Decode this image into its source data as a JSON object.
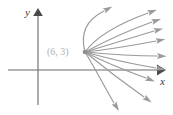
{
  "figure": {
    "type": "vector-field-diagram",
    "background_color": "#ffffff",
    "width": 173,
    "height": 115
  },
  "axes": {
    "x_label": "x",
    "y_label": "y",
    "axis_color": "#6b6b6b",
    "origin_px": [
      38,
      70
    ],
    "x_axis_px": [
      8,
      70,
      160,
      70
    ],
    "y_axis_px": [
      38,
      105,
      38,
      12
    ],
    "ticks": [],
    "grid": false
  },
  "annotations": {
    "point_label": "(6, 3)",
    "point_label_color": "#b2b2b2",
    "point_px": [
      85,
      52
    ]
  },
  "chart_data": {
    "type": "scatter",
    "title": "",
    "xlabel": "x",
    "ylabel": "y",
    "grid": false,
    "legend": "none",
    "curve_color": "#9a9a9a",
    "source_point": {
      "label": "(6, 3)",
      "x": 6,
      "y": 3
    },
    "curves": [
      {
        "id": "curve-1",
        "path": "M 85 52 C 80 34 86 20 104 11",
        "tip": [
          104,
          11
        ],
        "angle_deg": -28
      },
      {
        "id": "curve-2",
        "path": "M 85 52 C 95 38 118 24 148 13",
        "tip": [
          148,
          13
        ],
        "angle_deg": -20
      },
      {
        "id": "curve-3",
        "path": "M 85 52 C 100 44 124 32 152 22",
        "tip": [
          152,
          22
        ],
        "angle_deg": -18
      },
      {
        "id": "curve-4",
        "path": "M 85 52 C 102 47 128 39 154 31",
        "tip": [
          154,
          31
        ],
        "angle_deg": -15
      },
      {
        "id": "curve-5",
        "path": "M 85 52 C 104 50 130 46 156 41",
        "tip": [
          156,
          41
        ],
        "angle_deg": -11
      },
      {
        "id": "curve-6",
        "path": "M 85 52 C 106 54 132 56 157 56",
        "tip": [
          157,
          56
        ],
        "angle_deg": 2
      },
      {
        "id": "curve-7",
        "path": "M 85 52 C 106 58 132 64 156 68",
        "tip": [
          156,
          68
        ],
        "angle_deg": 10
      },
      {
        "id": "curve-8",
        "path": "M 85 52 C 104 62 124 70 146 78",
        "tip": [
          146,
          78
        ],
        "angle_deg": 22
      },
      {
        "id": "curve-9",
        "path": "M 85 52 C 102 66 120 80 144 97",
        "tip": [
          144,
          97
        ],
        "angle_deg": 36
      },
      {
        "id": "curve-10",
        "path": "M 85 52 C 96 70 104 86 114 103",
        "tip": [
          114,
          103
        ],
        "angle_deg": 58
      }
    ]
  }
}
